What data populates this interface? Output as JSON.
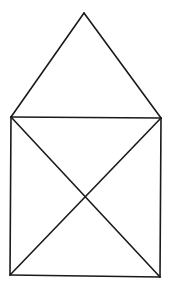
{
  "diagram": {
    "stroke_color": "#1a1a1a",
    "stroke_width": 1.6,
    "background": "#ffffff",
    "vertices": {
      "apex": [
        84,
        13
      ],
      "top_left": [
        11,
        117
      ],
      "top_right": [
        161,
        118
      ],
      "bottom_left": [
        10,
        275
      ],
      "bottom_right": [
        160,
        277
      ],
      "center": [
        85,
        197
      ]
    },
    "shapes": [
      {
        "name": "roof-left-edge",
        "from": "top_left",
        "to": "apex"
      },
      {
        "name": "roof-right-edge",
        "from": "apex",
        "to": "top_right"
      },
      {
        "name": "square-top-edge",
        "from": "top_left",
        "to": "top_right"
      },
      {
        "name": "square-left-edge",
        "from": "top_left",
        "to": "bottom_left"
      },
      {
        "name": "square-right-edge",
        "from": "top_right",
        "to": "bottom_right"
      },
      {
        "name": "square-bottom-edge",
        "from": "bottom_left",
        "to": "bottom_right"
      },
      {
        "name": "diagonal-tl-br",
        "from": "top_left",
        "to": "bottom_right"
      },
      {
        "name": "diagonal-tr-bl",
        "from": "top_right",
        "to": "bottom_left"
      }
    ]
  }
}
